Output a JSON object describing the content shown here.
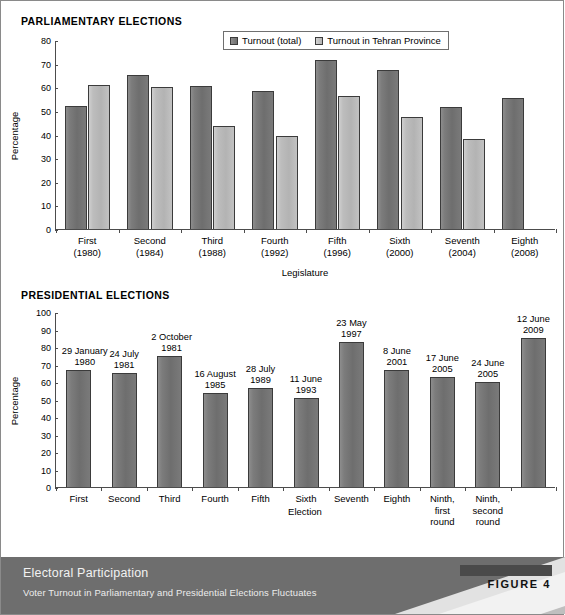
{
  "figure": {
    "footer_title": "Electoral Participation",
    "footer_subtitle": "Voter Turnout in Parliamentary and Presidential Elections Fluctuates",
    "figure_label": "FIGURE 4"
  },
  "section1_title": "PARLIAMENTARY ELECTIONS",
  "section2_title": "PRESIDENTIAL ELECTIONS",
  "colors": {
    "series1": "#757575",
    "series2": "#bdbdbd",
    "axis": "#4c4c4c",
    "footer_dark": "#6e6e6e",
    "footer_light": "#d9d9d9"
  },
  "chart_data": [
    {
      "type": "bar",
      "title": "PARLIAMENTARY ELECTIONS",
      "xlabel": "Legislature",
      "ylabel": "Percentage",
      "ylim": [
        0,
        80
      ],
      "yticks": [
        0,
        10,
        20,
        30,
        40,
        50,
        60,
        70,
        80
      ],
      "grid": false,
      "legend_position": "top-center",
      "categories": [
        "First\n(1980)",
        "Second\n(1984)",
        "Third\n(1988)",
        "Fourth\n(1992)",
        "Fifth\n(1996)",
        "Sixth\n(2000)",
        "Seventh\n(2004)",
        "Eighth\n(2008)"
      ],
      "category_lines": [
        [
          "First",
          "(1980)"
        ],
        [
          "Second",
          "(1984)"
        ],
        [
          "Third",
          "(1988)"
        ],
        [
          "Fourth",
          "(1992)"
        ],
        [
          "Fifth",
          "(1996)"
        ],
        [
          "Sixth",
          "(2000)"
        ],
        [
          "Seventh",
          "(2004)"
        ],
        [
          "Eighth",
          "(2008)"
        ]
      ],
      "series": [
        {
          "name": "Turnout (total)",
          "values": [
            52,
            65,
            60.5,
            58.5,
            71.5,
            67.5,
            51.5,
            55.5
          ]
        },
        {
          "name": "Turnout in Tehran Province",
          "values": [
            61,
            60,
            43.5,
            39.5,
            56.5,
            47.5,
            38,
            null
          ]
        }
      ]
    },
    {
      "type": "bar",
      "title": "PRESIDENTIAL ELECTIONS",
      "xlabel": "Election",
      "ylabel": "Percentage",
      "ylim": [
        0,
        100
      ],
      "yticks": [
        0,
        10,
        20,
        30,
        40,
        50,
        60,
        70,
        80,
        90,
        100
      ],
      "grid": false,
      "categories": [
        "First",
        "Second",
        "Third",
        "Fourth",
        "Fifth",
        "Sixth",
        "Seventh",
        "Eighth",
        "Ninth,\nfirst\nround",
        "Ninth,\nsecond\nround",
        ""
      ],
      "category_lines": [
        [
          "First"
        ],
        [
          "Second"
        ],
        [
          "Third"
        ],
        [
          "Fourth"
        ],
        [
          "Fifth"
        ],
        [
          "Sixth"
        ],
        [
          "Seventh"
        ],
        [
          "Eighth"
        ],
        [
          "Ninth,",
          "first",
          "round"
        ],
        [
          "Ninth,",
          "second",
          "round"
        ],
        [
          ""
        ]
      ],
      "values": [
        67,
        65,
        75,
        54,
        56.5,
        51,
        83,
        67,
        63,
        60,
        85
      ],
      "point_labels": [
        [
          "29 January",
          "1980"
        ],
        [
          "24 July",
          "1981"
        ],
        [
          "2 October",
          "1981"
        ],
        [
          "16 August",
          "1985"
        ],
        [
          "28 July",
          "1989"
        ],
        [
          "11 June",
          "1993"
        ],
        [
          "23 May",
          "1997"
        ],
        [
          "8 June",
          "2001"
        ],
        [
          "17 June",
          "2005"
        ],
        [
          "24 June",
          "2005"
        ],
        [
          "12 June",
          "2009"
        ]
      ],
      "series": [
        {
          "name": "Turnout",
          "values": [
            67,
            65,
            75,
            54,
            56.5,
            51,
            83,
            67,
            63,
            60,
            85
          ]
        }
      ]
    }
  ]
}
